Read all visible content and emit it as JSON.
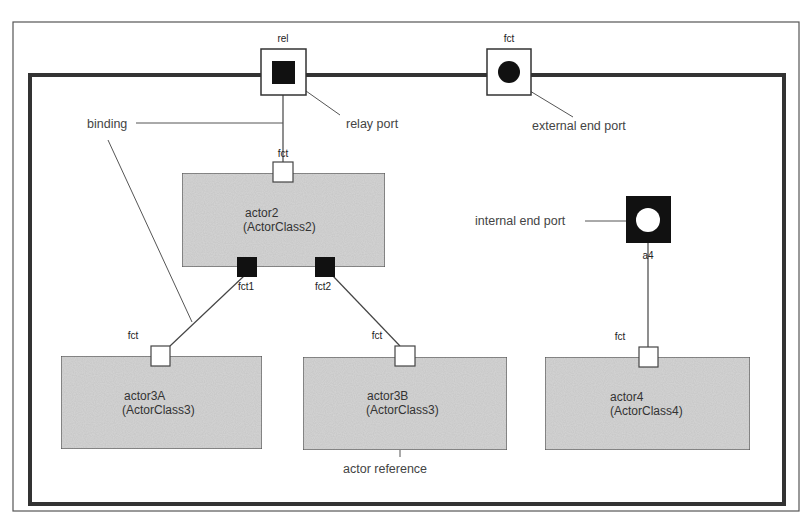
{
  "diagram": {
    "colors": {
      "frame": "#444444",
      "actor_fill": "#d6d6d6",
      "actor_stroke": "#555555",
      "port_fill_dark": "#111111",
      "annotation_text": "#444444"
    },
    "outer_frame": {
      "relay_port": {
        "label": "rel",
        "kind": "relay"
      },
      "external_end_port": {
        "label": "fct",
        "kind": "external-end"
      }
    },
    "internal_end_port": {
      "label": "a4",
      "kind": "internal-end"
    },
    "actors": [
      {
        "name": "actor2",
        "class": "(ActorClass2)",
        "ports": [
          {
            "label": "fct",
            "position": "top",
            "style": "hollow"
          },
          {
            "label": "fct1",
            "position": "bottom",
            "style": "filled"
          },
          {
            "label": "fct2",
            "position": "bottom",
            "style": "filled"
          }
        ]
      },
      {
        "name": "actor3A",
        "class": "(ActorClass3)",
        "ports": [
          {
            "label": "fct",
            "position": "top",
            "style": "hollow"
          }
        ]
      },
      {
        "name": "actor3B",
        "class": "(ActorClass3)",
        "ports": [
          {
            "label": "fct",
            "position": "top",
            "style": "hollow"
          }
        ]
      },
      {
        "name": "actor4",
        "class": "(ActorClass4)",
        "ports": [
          {
            "label": "fct",
            "position": "top",
            "style": "hollow"
          }
        ]
      }
    ],
    "bindings": [
      {
        "from": "rel",
        "to": "actor2.fct"
      },
      {
        "from": "actor2.fct1",
        "to": "actor3A.fct"
      },
      {
        "from": "actor2.fct2",
        "to": "actor3B.fct"
      },
      {
        "from": "a4",
        "to": "actor4.fct"
      }
    ],
    "annotations": {
      "binding": "binding",
      "relay_port": "relay port",
      "external_end_port": "external end port",
      "internal_end_port": "internal end port",
      "actor_reference": "actor reference"
    }
  }
}
